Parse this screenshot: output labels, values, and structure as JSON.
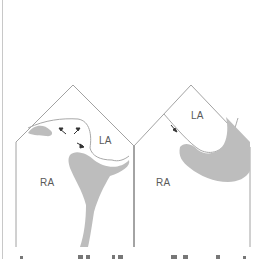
{
  "figure": {
    "panels": [
      {
        "id": "left",
        "labels": {
          "ra": "RA",
          "la": "LA"
        },
        "arrow_count": 3
      },
      {
        "id": "right",
        "labels": {
          "ra": "RA",
          "la": "LA"
        },
        "arrow_count": 1
      }
    ],
    "colors": {
      "outline": "#8a8a8a",
      "fill": "#bdbdbd",
      "arrow": "#333333"
    },
    "caption_cropped": true
  }
}
